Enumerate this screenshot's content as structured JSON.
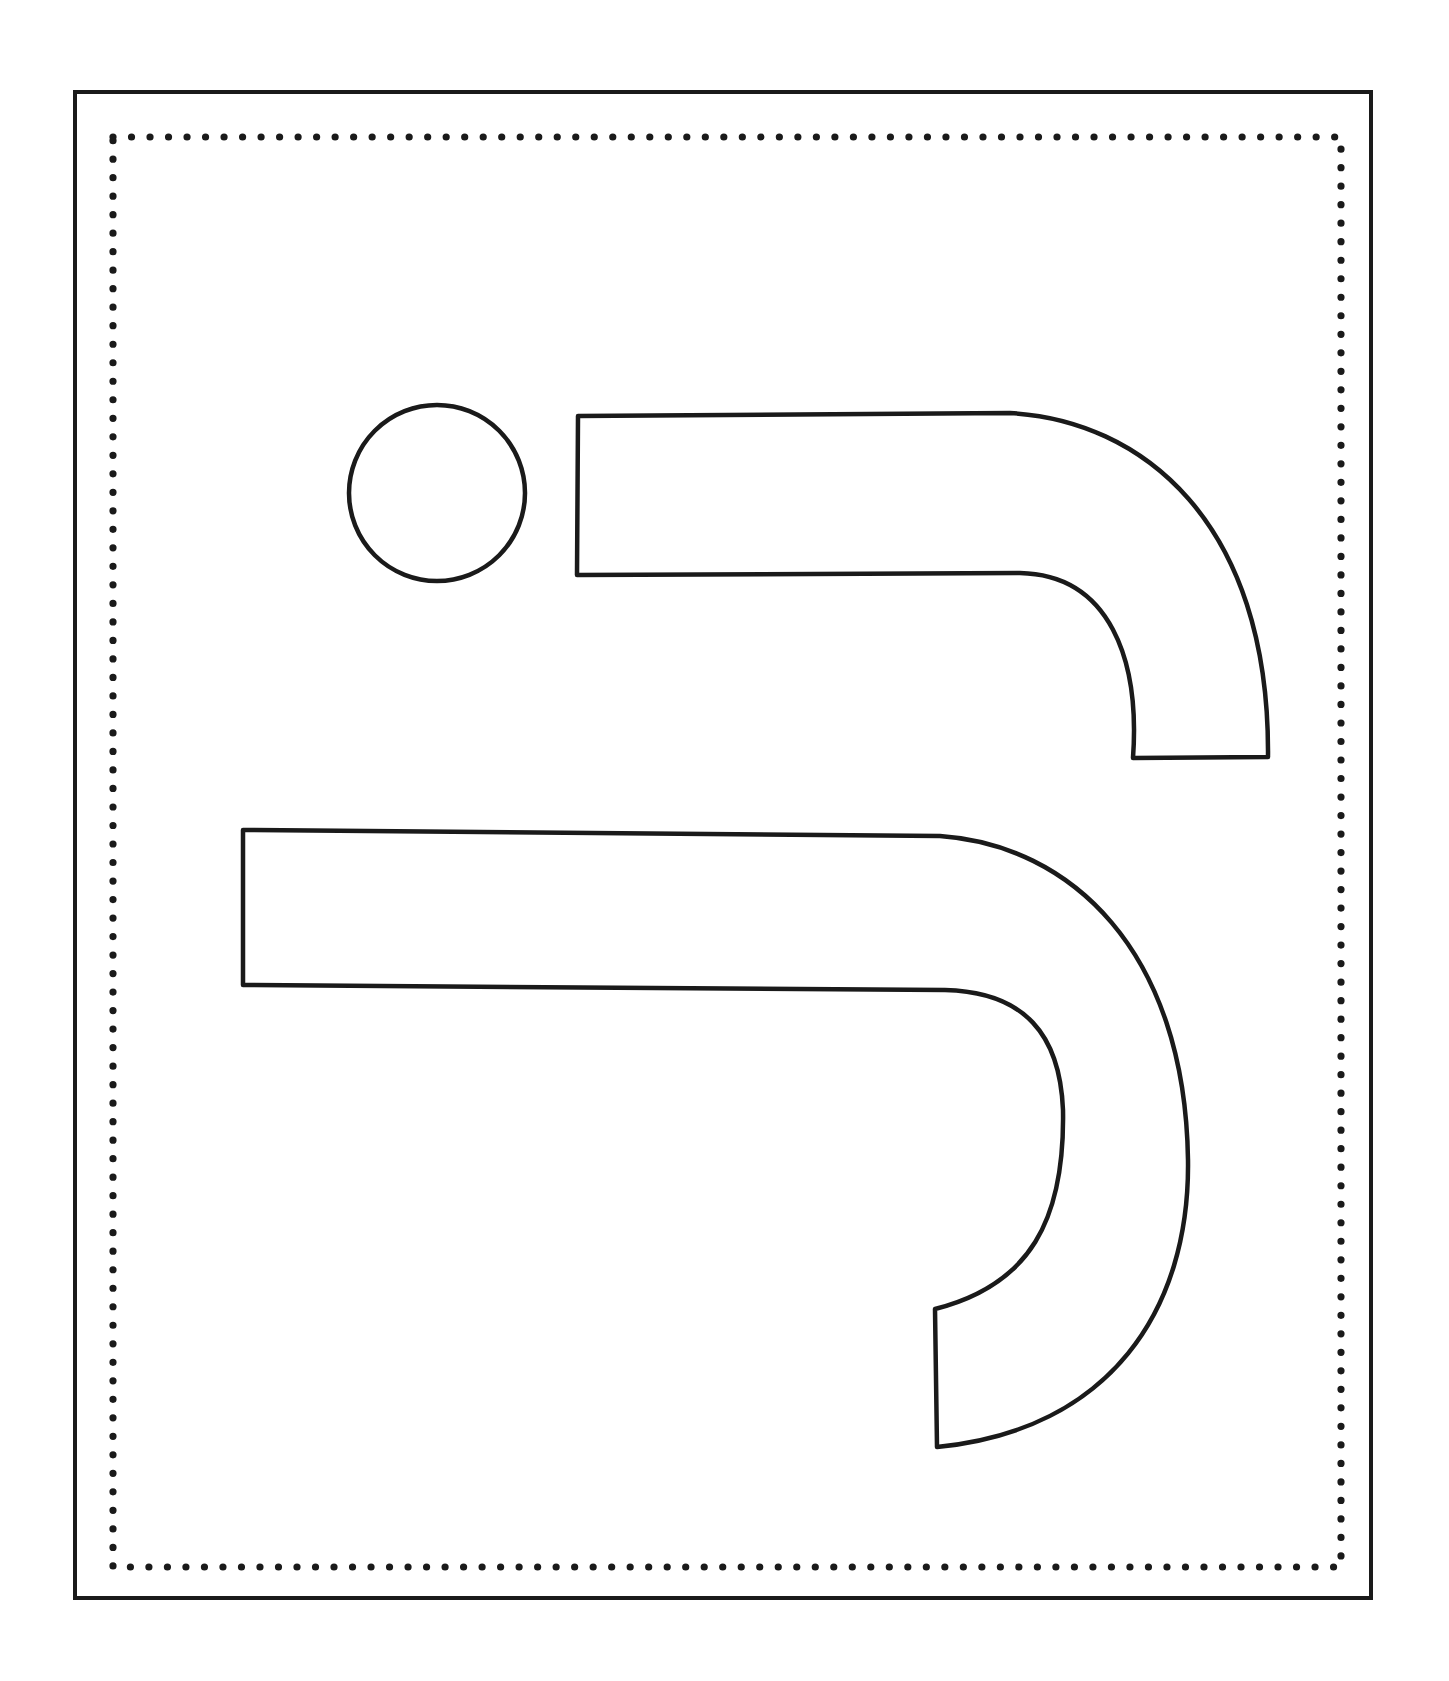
{
  "worksheet": {
    "background_color": "#ffffff",
    "ink_color": "#1a1a1a",
    "outer_frame": {
      "style": "solid",
      "x": 75,
      "y": 92,
      "width": 1296,
      "height": 1506,
      "stroke_width": 4
    },
    "inner_frame": {
      "style": "dotted",
      "x": 113,
      "y": 137,
      "width": 1228,
      "height": 1430,
      "dot_spacing": 18.5,
      "dot_radius": 3.6
    },
    "shapes": [
      {
        "name": "circle",
        "icon": "circle-outline",
        "cx": 437,
        "cy": 493,
        "r": 88
      },
      {
        "name": "small-hook",
        "icon": "hook-shape-outline"
      },
      {
        "name": "large-hook",
        "icon": "hook-shape-outline"
      }
    ]
  }
}
